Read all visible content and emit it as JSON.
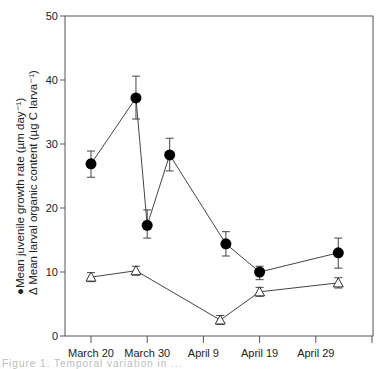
{
  "chart_data": {
    "type": "line",
    "title": "",
    "xlabel": "",
    "ylabel": [
      "Mean juvenile growth rate (µm day⁻¹)",
      "Δ Mean larval organic content (µg C larva⁻¹)"
    ],
    "ylim": [
      0,
      50
    ],
    "yticks": [
      0,
      10,
      20,
      30,
      40,
      50
    ],
    "xtick_labels": [
      "March 20",
      "March 30",
      "April 9",
      "April 19",
      "April 29"
    ],
    "grid": false,
    "legend_position": "y-axis label",
    "series": [
      {
        "name": "Mean juvenile growth rate (µm day⁻¹)",
        "marker": "filled-circle",
        "x_days_from_march20": [
          0,
          8,
          10,
          14,
          24,
          30,
          44
        ],
        "x_dates": [
          "March 20",
          "March 28",
          "March 30",
          "April 3",
          "April 13",
          "April 19",
          "May 3"
        ],
        "values": [
          26.9,
          37.2,
          17.3,
          28.3,
          14.4,
          10.0,
          13.0
        ],
        "error_low": [
          24.8,
          33.9,
          15.3,
          25.8,
          12.5,
          8.8,
          10.6
        ],
        "error_high": [
          28.9,
          40.6,
          19.7,
          30.9,
          16.3,
          10.9,
          15.3
        ]
      },
      {
        "name": "Mean larval organic content (µg C larva⁻¹)",
        "marker": "open-triangle",
        "x_days_from_march20": [
          0,
          8,
          23,
          30,
          44
        ],
        "x_dates": [
          "March 20",
          "March 28",
          "April 12",
          "April 19",
          "May 3"
        ],
        "values": [
          9.2,
          10.2,
          2.5,
          6.9,
          8.3
        ],
        "error_low": [
          8.5,
          9.5,
          1.8,
          6.2,
          7.5
        ],
        "error_high": [
          9.9,
          10.9,
          3.2,
          7.6,
          9.1
        ]
      }
    ]
  },
  "labels": {
    "ylabel_line1": "●Mean juvenile growth rate (µm day⁻¹)",
    "ylabel_line2": "Δ Mean larval organic content (µg C larva⁻¹)",
    "caption": "Figure 1. Temporal variation in ..."
  }
}
